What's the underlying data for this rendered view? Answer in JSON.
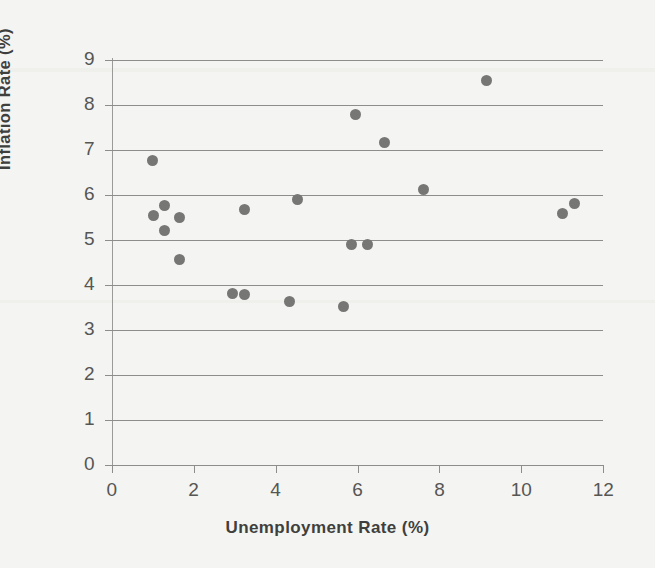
{
  "chart_data": {
    "type": "scatter",
    "title": "",
    "xlabel": "Unemployment Rate (%)",
    "ylabel": "Inflation Rate (%)",
    "xlim": [
      0,
      12
    ],
    "ylim": [
      0,
      9
    ],
    "xticks": [
      "0",
      "2",
      "4",
      "6",
      "8",
      "10",
      "12"
    ],
    "yticks": [
      "0",
      "1",
      "2",
      "3",
      "4",
      "5",
      "6",
      "7",
      "8",
      "9"
    ],
    "xtick_values": [
      0,
      2,
      4,
      6,
      8,
      10,
      12
    ],
    "ytick_values": [
      0,
      1,
      2,
      3,
      4,
      5,
      6,
      7,
      8,
      9
    ],
    "grid": "horizontal",
    "legend": "none",
    "marker_color": "#767674",
    "marker_size": 11,
    "points": [
      {
        "x": 1.0,
        "y": 6.76
      },
      {
        "x": 1.03,
        "y": 5.54
      },
      {
        "x": 1.3,
        "y": 5.76
      },
      {
        "x": 1.3,
        "y": 5.22
      },
      {
        "x": 1.65,
        "y": 5.5
      },
      {
        "x": 1.65,
        "y": 4.56
      },
      {
        "x": 2.95,
        "y": 3.81
      },
      {
        "x": 3.23,
        "y": 3.8
      },
      {
        "x": 3.25,
        "y": 5.68
      },
      {
        "x": 4.33,
        "y": 3.63
      },
      {
        "x": 4.53,
        "y": 5.9
      },
      {
        "x": 5.67,
        "y": 3.53
      },
      {
        "x": 5.85,
        "y": 4.89
      },
      {
        "x": 5.95,
        "y": 7.78
      },
      {
        "x": 6.25,
        "y": 4.9
      },
      {
        "x": 6.65,
        "y": 7.17
      },
      {
        "x": 7.6,
        "y": 6.12
      },
      {
        "x": 9.15,
        "y": 8.55
      },
      {
        "x": 11.0,
        "y": 5.6
      },
      {
        "x": 11.3,
        "y": 5.82
      }
    ]
  },
  "axis": {
    "x_title": "Unemployment Rate (%)",
    "y_title": "Inflation Rate (%)"
  },
  "colors": {
    "background": "#f4f4f2",
    "marker": "#767674",
    "gridline": "#8d8d8b",
    "text": "#3f3f3d",
    "tick_text": "#565654"
  }
}
